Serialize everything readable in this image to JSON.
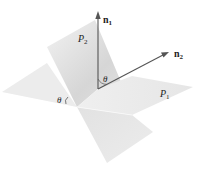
{
  "figure": {
    "planes": [
      {
        "name": "P1",
        "label_main": "P",
        "label_sub": "1"
      },
      {
        "name": "P2",
        "label_main": "P",
        "label_sub": "2"
      }
    ],
    "vectors": [
      {
        "name": "n1",
        "label_main": "n",
        "label_sub": "1"
      },
      {
        "name": "n2",
        "label_main": "n",
        "label_sub": "2"
      }
    ],
    "angles": {
      "between_normals": "θ",
      "between_planes": "θ"
    },
    "colors": {
      "plane_light": "#ececec",
      "plane_mid": "#dcdcdc",
      "plane_dark": "#c8c8c8",
      "arrow": "#555555",
      "text": "#222222"
    }
  }
}
